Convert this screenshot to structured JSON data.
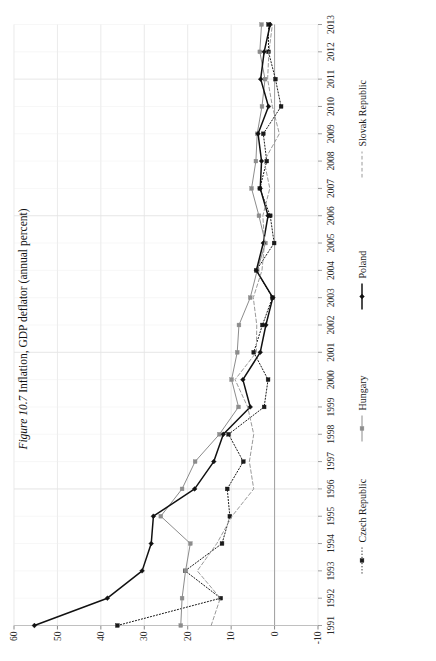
{
  "figure": {
    "number_label": "Figure 10.7",
    "caption_text": "Inflation, GDP deflator (annual percent)"
  },
  "chart_data": {
    "type": "line",
    "title": "Inflation, GDP deflator (annual percent)",
    "xlabel": "",
    "ylabel": "",
    "grid": true,
    "legend_position": "bottom",
    "orientation": "page-rotated-90",
    "xlim": [
      1991,
      2013
    ],
    "ylim": [
      -10,
      60
    ],
    "yticks": [
      60,
      50,
      40,
      30,
      20,
      10,
      0,
      -10
    ],
    "ytick_labels": [
      "60",
      "50",
      "40",
      "30",
      "20",
      "10",
      "0",
      "-10"
    ],
    "x": [
      1991,
      1992,
      1993,
      1994,
      1995,
      1996,
      1997,
      1998,
      1999,
      2000,
      2001,
      2002,
      2003,
      2004,
      2005,
      2006,
      2007,
      2008,
      2009,
      2010,
      2011,
      2012,
      2013
    ],
    "categories": [
      "1991",
      "1992",
      "1993",
      "1994",
      "1995",
      "1996",
      "1997",
      "1998",
      "1999",
      "2000",
      "2001",
      "2002",
      "2003",
      "2004",
      "2005",
      "2006",
      "2007",
      "2008",
      "2009",
      "2010",
      "2011",
      "2012",
      "2013"
    ],
    "series": [
      {
        "name": "Czech Republic",
        "color": "#1a1a1a",
        "style": "dotted",
        "marker": "square",
        "values": [
          36.2,
          12.4,
          20.6,
          12.1,
          10.3,
          10.9,
          7.2,
          10.6,
          2.4,
          1.5,
          4.8,
          2.8,
          0.5,
          4.2,
          0.1,
          1.0,
          3.4,
          1.8,
          2.6,
          -1.5,
          -0.2,
          1.4,
          1.4
        ]
      },
      {
        "name": "Hungary",
        "color": "#8c8c8c",
        "style": "solid",
        "marker": "square",
        "values": [
          21.6,
          21.3,
          20.5,
          19.4,
          26.2,
          21.3,
          18.3,
          12.7,
          8.3,
          9.9,
          8.6,
          8.2,
          5.6,
          4.0,
          2.1,
          3.6,
          5.3,
          4.3,
          4.0,
          2.9,
          2.2,
          3.4,
          3.0
        ]
      },
      {
        "name": "Poland",
        "color": "#111111",
        "style": "solid",
        "marker": "diamond",
        "values": [
          55.3,
          38.5,
          30.5,
          28.4,
          27.9,
          18.4,
          14.0,
          11.8,
          5.6,
          7.3,
          3.3,
          2.0,
          0.4,
          4.2,
          2.6,
          1.5,
          3.3,
          3.0,
          3.8,
          1.4,
          3.2,
          2.4,
          1.0
        ]
      },
      {
        "name": "Slovak Republic",
        "color": "#9a9a9a",
        "style": "dashed",
        "marker": "none",
        "values": [
          14.6,
          12.5,
          17.8,
          13.3,
          9.8,
          4.8,
          5.8,
          4.8,
          6.2,
          9.1,
          4.2,
          4.1,
          4.9,
          2.9,
          2.3,
          2.7,
          1.1,
          2.4,
          -1.1,
          0.5,
          1.6,
          1.3,
          0.5
        ]
      }
    ]
  },
  "legend": {
    "items": [
      {
        "label": "Czech Republic"
      },
      {
        "label": "Hungary"
      },
      {
        "label": "Poland"
      },
      {
        "label": "Slovak Republic"
      }
    ]
  }
}
